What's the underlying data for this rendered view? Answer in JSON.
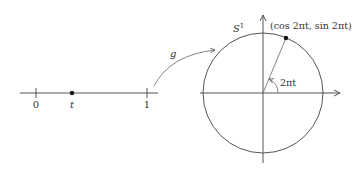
{
  "diagram": {
    "interval": {
      "tick_labels": [
        "0",
        "t",
        "1"
      ]
    },
    "map_label": "g",
    "circle_label": "S",
    "circle_label_sup": "1",
    "point_label": "(cos 2πt, sin 2πt)",
    "angle_label": "2πt",
    "colors": {
      "stroke": "#555555",
      "point": "#111111"
    }
  }
}
